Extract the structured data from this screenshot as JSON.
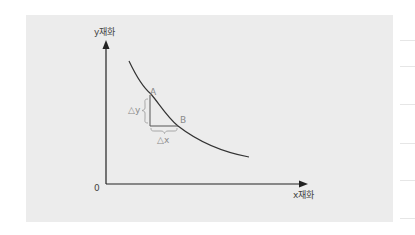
{
  "diagram": {
    "y_axis_label": "y재화",
    "x_axis_label": "x재화",
    "origin_label": "0",
    "point_a_label": "A",
    "point_b_label": "B",
    "delta_y_label": "△y",
    "delta_x_label": "△x",
    "colors": {
      "panel": "#ececec",
      "axis": "#222222",
      "curve": "#333333",
      "triangle": "#555555",
      "brace": "#a0a0a0"
    }
  }
}
